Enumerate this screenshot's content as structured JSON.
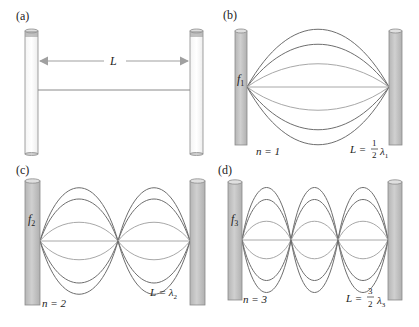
{
  "figure": {
    "panels": [
      {
        "id": "a",
        "label": "(a)",
        "length_label": "L",
        "description": "string stretched between two posts at rest"
      },
      {
        "id": "b",
        "label": "(b)",
        "freq_label": "f",
        "freq_sub": "1",
        "mode_label": "n = 1",
        "relation_lhs": "L =",
        "relation_num": "1",
        "relation_den": "2",
        "relation_lambda": "λ",
        "relation_sub": "1",
        "loops": 1
      },
      {
        "id": "c",
        "label": "(c)",
        "freq_label": "f",
        "freq_sub": "2",
        "mode_label": "n = 2",
        "relation_lhs": "L = λ",
        "relation_sub": "2",
        "loops": 2
      },
      {
        "id": "d",
        "label": "(d)",
        "freq_label": "f",
        "freq_sub": "3",
        "mode_label": "n = 3",
        "relation_lhs": "L =",
        "relation_num": "3",
        "relation_den": "2",
        "relation_lambda": "λ",
        "relation_sub": "3",
        "loops": 3
      }
    ],
    "colors": {
      "post_fill": "#c8c8c8",
      "post_stroke": "#8a8a8a",
      "string_dark": "#6e6e6e",
      "string_light": "#a8a8a8",
      "arrow": "#a0a0a0",
      "text": "#222222"
    }
  }
}
